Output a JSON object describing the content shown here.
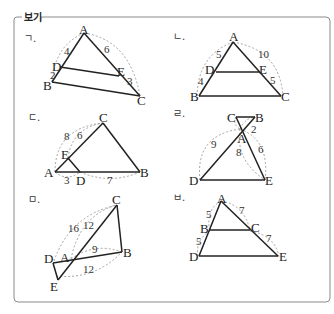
{
  "box": {
    "title": "보기"
  },
  "figures": [
    {
      "tag": "ㄱ.",
      "points": {
        "A": "A",
        "B": "B",
        "C": "C",
        "D": "D",
        "E": "E"
      },
      "lengths": {
        "AD": "4",
        "DB": "2",
        "AE": "6",
        "EC": "3"
      }
    },
    {
      "tag": "ㄴ.",
      "points": {
        "A": "A",
        "B": "B",
        "C": "C",
        "D": "D",
        "E": "E"
      },
      "lengths": {
        "AD": "5",
        "DB": "4",
        "AE": "10",
        "EC": "5"
      }
    },
    {
      "tag": "ㄷ.",
      "points": {
        "A": "A",
        "B": "B",
        "C": "C",
        "D": "D",
        "E": "E"
      },
      "lengths": {
        "AC": "8",
        "EC": "6",
        "AD": "3",
        "DB": "7"
      }
    },
    {
      "tag": "ㄹ.",
      "points": {
        "A": "A",
        "B": "B",
        "C": "C",
        "D": "D",
        "E": "E"
      },
      "lengths": {
        "AB": "2",
        "AD": "9",
        "AE": "6",
        "AC_ext": "8"
      }
    },
    {
      "tag": "ㅁ.",
      "points": {
        "A": "A",
        "B": "B",
        "C": "C",
        "D": "D",
        "E": "E"
      },
      "lengths": {
        "DC": "16",
        "AC": "12",
        "AB": "9",
        "EB": "12"
      }
    },
    {
      "tag": "ㅂ.",
      "points": {
        "A": "A",
        "B": "B",
        "C": "C",
        "D": "D",
        "E": "E"
      },
      "lengths": {
        "AB": "5",
        "BD": "5",
        "AC": "7",
        "CE": "7"
      }
    }
  ]
}
